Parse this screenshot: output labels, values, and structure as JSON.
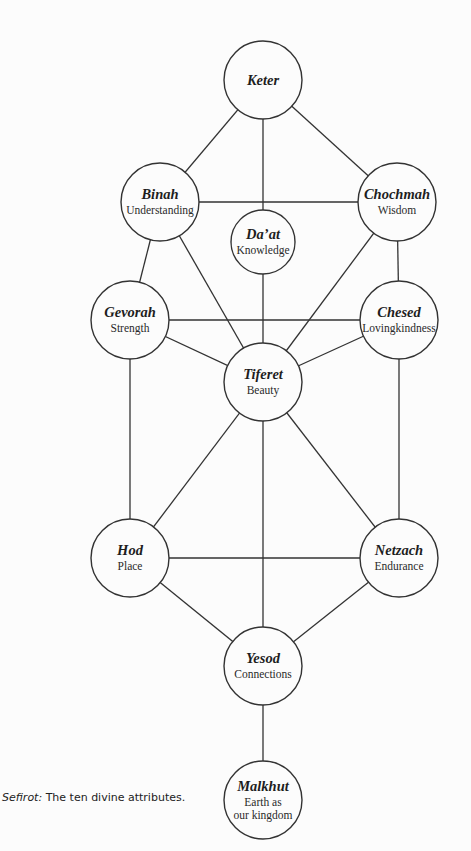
{
  "diagram": {
    "title": "Sefirot",
    "nodes": [
      {
        "id": "keter",
        "title": "Keter",
        "subtitle": [],
        "cx": 263,
        "cy": 80,
        "r": 39
      },
      {
        "id": "binah",
        "title": "Binah",
        "subtitle": [
          "Understanding"
        ],
        "cx": 160,
        "cy": 202,
        "r": 39
      },
      {
        "id": "chochmah",
        "title": "Chochmah",
        "subtitle": [
          "Wisdom"
        ],
        "cx": 397,
        "cy": 202,
        "r": 39
      },
      {
        "id": "daat",
        "title": "Da’at",
        "subtitle": [
          "Knowledge"
        ],
        "cx": 263,
        "cy": 242,
        "r": 32
      },
      {
        "id": "gevorah",
        "title": "Gevorah",
        "subtitle": [
          "Strength"
        ],
        "cx": 130,
        "cy": 320,
        "r": 39
      },
      {
        "id": "chesed",
        "title": "Chesed",
        "subtitle": [
          "Lovingkindness"
        ],
        "cx": 399,
        "cy": 320,
        "r": 39
      },
      {
        "id": "tiferet",
        "title": "Tiferet",
        "subtitle": [
          "Beauty"
        ],
        "cx": 263,
        "cy": 382,
        "r": 39
      },
      {
        "id": "hod",
        "title": "Hod",
        "subtitle": [
          "Place"
        ],
        "cx": 130,
        "cy": 558,
        "r": 39
      },
      {
        "id": "netzach",
        "title": "Netzach",
        "subtitle": [
          "Endurance"
        ],
        "cx": 399,
        "cy": 558,
        "r": 39
      },
      {
        "id": "yesod",
        "title": "Yesod",
        "subtitle": [
          "Connections"
        ],
        "cx": 263,
        "cy": 666,
        "r": 39
      },
      {
        "id": "malkhut",
        "title": "Malkhut",
        "subtitle": [
          "Earth as",
          "our kingdom"
        ],
        "cx": 263,
        "cy": 800,
        "r": 39
      }
    ],
    "edges": [
      [
        "keter",
        "binah"
      ],
      [
        "keter",
        "chochmah"
      ],
      [
        "keter",
        "daat"
      ],
      [
        "binah",
        "chochmah"
      ],
      [
        "binah",
        "gevorah"
      ],
      [
        "binah",
        "tiferet"
      ],
      [
        "chochmah",
        "chesed"
      ],
      [
        "chochmah",
        "tiferet"
      ],
      [
        "daat",
        "tiferet"
      ],
      [
        "gevorah",
        "chesed"
      ],
      [
        "gevorah",
        "tiferet"
      ],
      [
        "gevorah",
        "hod"
      ],
      [
        "chesed",
        "tiferet"
      ],
      [
        "chesed",
        "netzach"
      ],
      [
        "tiferet",
        "hod"
      ],
      [
        "tiferet",
        "netzach"
      ],
      [
        "tiferet",
        "yesod"
      ],
      [
        "hod",
        "netzach"
      ],
      [
        "hod",
        "yesod"
      ],
      [
        "netzach",
        "yesod"
      ],
      [
        "yesod",
        "malkhut"
      ]
    ]
  },
  "caption": {
    "term": "Sefirot:",
    "text": " The ten divine attributes."
  }
}
